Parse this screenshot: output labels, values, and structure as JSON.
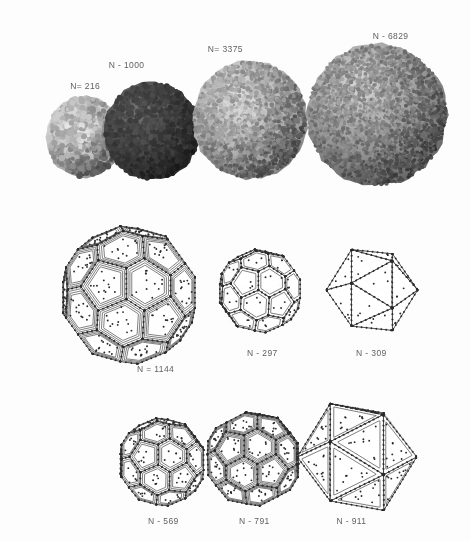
{
  "figure": {
    "kind": "scientific-figure",
    "background_color": "#fdfdfd",
    "label_color": "#4a4a4a"
  },
  "rows": [
    {
      "name": "space-filling-row",
      "style": "space-filling",
      "panels": [
        {
          "label": "N= 216",
          "n": 216,
          "render": "space-filling",
          "tone": "light",
          "fill": "#c9c9c9",
          "shade": "#8e8e8e",
          "highlight": "#ececec",
          "cx": 84,
          "cy": 137,
          "rx": 38,
          "ry": 41,
          "grain": 3.0,
          "density": 620,
          "label_x": 84,
          "label_y": 81
        },
        {
          "label": "N - 1000",
          "n": 1000,
          "render": "space-filling",
          "tone": "dark",
          "fill": "#4a4a4a",
          "shade": "#2a2a2a",
          "highlight": "#777777",
          "cx": 152,
          "cy": 131,
          "rx": 48,
          "ry": 49,
          "grain": 2.7,
          "density": 1050,
          "label_x": 125,
          "label_y": 60
        },
        {
          "label": "N= 3375",
          "n": 3375,
          "render": "space-filling",
          "tone": "light-mid",
          "fill": "#b6b6b6",
          "shade": "#7d7d7d",
          "highlight": "#e4e4e4",
          "cx": 250,
          "cy": 120,
          "rx": 57,
          "ry": 59,
          "grain": 2.3,
          "density": 1700,
          "label_x": 224,
          "label_y": 44
        },
        {
          "label": "N - 6829",
          "n": 6829,
          "render": "space-filling",
          "tone": "mid",
          "fill": "#9a9a9a",
          "shade": "#5f5f5f",
          "highlight": "#d8d8d8",
          "cx": 377,
          "cy": 115,
          "rx": 70,
          "ry": 71,
          "grain": 2.0,
          "density": 2500,
          "label_x": 389,
          "label_y": 31
        }
      ]
    },
    {
      "name": "wireframe-row-upper",
      "style": "wireframe",
      "panels": [
        {
          "label": "N = 1144",
          "n": 1144,
          "render": "truncated-octahedron",
          "cx": 129,
          "cy": 295,
          "r": 69,
          "facet_rings": 3,
          "vertex_dots": true,
          "label_x": 154,
          "label_y": 364
        },
        {
          "label": "N - 297",
          "n": 297,
          "render": "truncated-icosahedron",
          "cx": 260,
          "cy": 291,
          "r": 42,
          "facet_rings": 1,
          "vertex_dots": true,
          "label_x": 261,
          "label_y": 348
        },
        {
          "label": "N - 309",
          "n": 309,
          "render": "icosahedron",
          "cx": 372,
          "cy": 290,
          "r": 39,
          "facet_rings": 0,
          "vertex_dots": true,
          "label_x": 370,
          "label_y": 348
        }
      ]
    },
    {
      "name": "wireframe-row-lower",
      "style": "wireframe",
      "panels": [
        {
          "label": "N - 569",
          "n": 569,
          "render": "rhombicosidodecahedron",
          "cx": 162,
          "cy": 462,
          "r": 44,
          "facet_rings": 2,
          "vertex_dots": true,
          "label_x": 162,
          "label_y": 516
        },
        {
          "label": "N - 791",
          "n": 791,
          "render": "dense-polyhedron",
          "cx": 253,
          "cy": 459,
          "r": 48,
          "facet_rings": 3,
          "vertex_dots": true,
          "label_x": 253,
          "label_y": 516
        },
        {
          "label": "N - 911",
          "n": 911,
          "render": "icosahedron-faceted",
          "cx": 357,
          "cy": 457,
          "r": 51,
          "facet_rings": 1,
          "vertex_dots": true,
          "label_x": 350,
          "label_y": 516
        }
      ]
    }
  ]
}
